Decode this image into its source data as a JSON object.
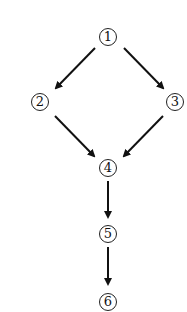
{
  "diagram": {
    "type": "directed-graph",
    "nodes": [
      {
        "id": "1",
        "label": "1",
        "x": 108,
        "y": 37
      },
      {
        "id": "2",
        "label": "2",
        "x": 40,
        "y": 102
      },
      {
        "id": "3",
        "label": "3",
        "x": 175,
        "y": 102
      },
      {
        "id": "4",
        "label": "4",
        "x": 108,
        "y": 168
      },
      {
        "id": "5",
        "label": "5",
        "x": 108,
        "y": 234
      },
      {
        "id": "6",
        "label": "6",
        "x": 108,
        "y": 302
      }
    ],
    "edges": [
      {
        "from": "1",
        "to": "2"
      },
      {
        "from": "1",
        "to": "3"
      },
      {
        "from": "2",
        "to": "4"
      },
      {
        "from": "3",
        "to": "4"
      },
      {
        "from": "4",
        "to": "5"
      },
      {
        "from": "5",
        "to": "6"
      }
    ]
  }
}
